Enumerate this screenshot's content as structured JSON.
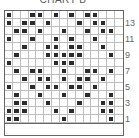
{
  "title": "CHART B",
  "chart_data": {
    "type": "table",
    "title": "CHART B",
    "columns": 15,
    "rows": 14,
    "row_labels": [
      "13",
      "11",
      "9",
      "7",
      "5",
      "3",
      "1"
    ],
    "filled_cells_by_row": {
      "14": [
        1,
        4,
        5,
        7,
        9,
        11,
        12
      ],
      "13": [
        1,
        3,
        4,
        6,
        10,
        12,
        13
      ],
      "12": [
        2,
        3,
        5,
        8,
        11,
        13,
        14
      ],
      "11": [
        1,
        4,
        7,
        9,
        12
      ],
      "10": [
        3,
        6,
        7,
        9,
        10,
        13
      ],
      "9": [
        2,
        6,
        7,
        8,
        9,
        10,
        14
      ],
      "8": [
        1,
        7,
        8,
        9
      ],
      "7": [
        2,
        4,
        5,
        8,
        11,
        12,
        14
      ],
      "6": [
        3,
        5,
        6,
        8,
        10,
        11,
        13
      ],
      "5": [
        1,
        4,
        6,
        7,
        9,
        10,
        12
      ],
      "4": [
        2,
        5,
        8,
        11,
        14
      ],
      "3": [
        2,
        3,
        6,
        10,
        13,
        14
      ],
      "2": [
        1,
        2,
        3,
        7,
        9,
        13,
        14
      ],
      "1": [
        1,
        2,
        8,
        14
      ]
    },
    "colors": {
      "filled": "#2b2b2b",
      "grid": "#bdbdbd",
      "border": "#666666"
    }
  },
  "labels": [
    {
      "text": "13",
      "row": 13
    },
    {
      "text": "11",
      "row": 11
    },
    {
      "text": "9",
      "row": 9
    },
    {
      "text": "7",
      "row": 7
    },
    {
      "text": "5",
      "row": 5
    },
    {
      "text": "3",
      "row": 3
    },
    {
      "text": "1",
      "row": 1
    }
  ]
}
